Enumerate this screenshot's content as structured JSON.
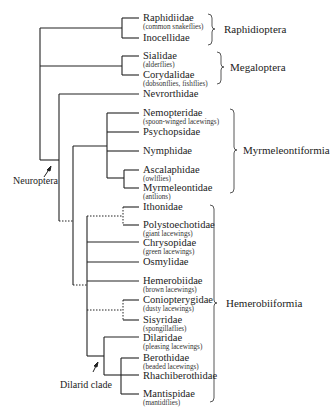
{
  "diagram": {
    "type": "phylogenetic-tree",
    "taxa": [
      {
        "name": "Raphidiidae",
        "common": "(common snakeflies)"
      },
      {
        "name": "Inocellidae",
        "common": ""
      },
      {
        "name": "Sialidae",
        "common": "(alderflies)"
      },
      {
        "name": "Corydalidae",
        "common": "(dobsonflies, fishflies)"
      },
      {
        "name": "Nevrorthidae",
        "common": ""
      },
      {
        "name": "Nemopteridae",
        "common": "(spoon-winged lacewings)"
      },
      {
        "name": "Psychopsidae",
        "common": ""
      },
      {
        "name": "Nymphidae",
        "common": ""
      },
      {
        "name": "Ascalaphidae",
        "common": "(owlflies)"
      },
      {
        "name": "Myrmeleontidae",
        "common": "(antlions)"
      },
      {
        "name": "Ithonidae",
        "common": ""
      },
      {
        "name": "Polystoechotidae",
        "common": "(giant lacewings)"
      },
      {
        "name": "Chrysopidae",
        "common": "(green lacewings)"
      },
      {
        "name": "Osmylidae",
        "common": ""
      },
      {
        "name": "Hemerobiidae",
        "common": "(brown lacewings)"
      },
      {
        "name": "Coniopterygidae",
        "common": "(dusty lacewings)"
      },
      {
        "name": "Sisyridae",
        "common": "(spongillaflies)"
      },
      {
        "name": "Dilaridae",
        "common": "(pleasing lacewings)"
      },
      {
        "name": "Berothidae",
        "common": "(beaded lacewings)"
      },
      {
        "name": "Rhachiberothidae",
        "common": ""
      },
      {
        "name": "Mantispidae",
        "common": "(mantidflies)"
      }
    ],
    "groups": [
      {
        "name": "Raphidioptera"
      },
      {
        "name": "Megaloptera"
      },
      {
        "name": "Myrmeleontiformia"
      },
      {
        "name": "Hemerobiiformia"
      }
    ],
    "annotations": {
      "neuroptera": "Neuroptera",
      "dilarid": "Dilarid clade"
    }
  }
}
